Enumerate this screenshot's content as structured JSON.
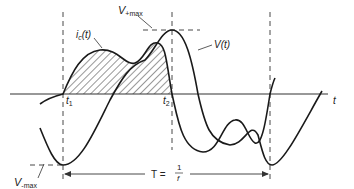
{
  "diagram": {
    "type": "waveform",
    "labels": {
      "v_plus_max": "V",
      "v_plus_max_sub": "+max",
      "v_minus_max": "V",
      "v_minus_max_sub": "-max",
      "ic": "i",
      "ic_sub": "c",
      "ic_arg": "(t)",
      "vt": "V(t)",
      "t1": "t",
      "t1_sub": "1",
      "t2": "t",
      "t2_sub": "2",
      "t_axis": "t",
      "period_lhs": "T =",
      "period_num": "1",
      "period_den": "f"
    },
    "colors": {
      "stroke": "#1a1a1a",
      "axis": "#333333",
      "background": "#ffffff"
    }
  }
}
